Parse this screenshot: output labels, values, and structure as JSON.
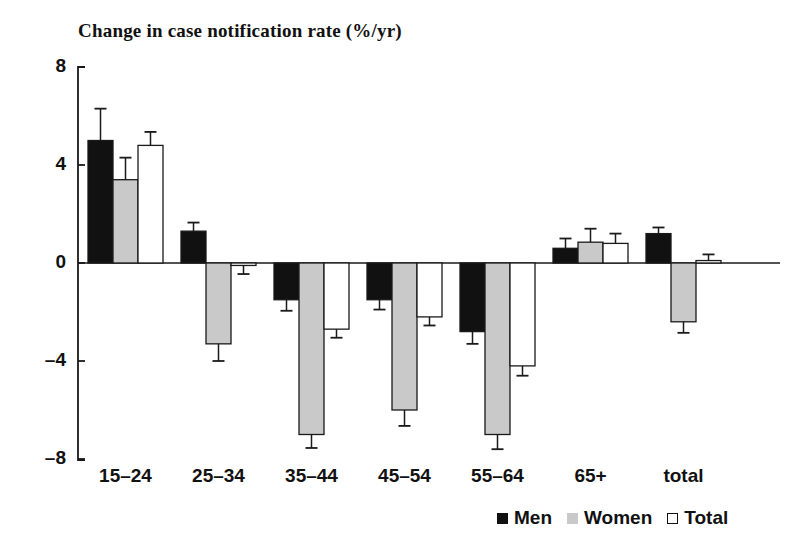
{
  "chart_data": {
    "type": "bar",
    "title": "Change in case notification rate (%/yr)",
    "xlabel": "",
    "ylabel": "",
    "ylim": [
      -8,
      8
    ],
    "yticks": [
      8,
      4,
      0,
      -4,
      -8
    ],
    "ytick_labels": [
      "8",
      "4",
      "0",
      "–4",
      "–8"
    ],
    "grid": false,
    "legend_position": "bottom-right",
    "error_bars": true,
    "categories": [
      "15–24",
      "25–34",
      "35–44",
      "45–54",
      "55–64",
      "65+",
      "total"
    ],
    "series": [
      {
        "name": "Men",
        "color": "#111111",
        "values": [
          5.0,
          1.3,
          -1.5,
          -1.5,
          -2.8,
          0.6,
          1.2
        ],
        "errors": [
          1.3,
          0.35,
          0.45,
          0.4,
          0.5,
          0.4,
          0.25
        ]
      },
      {
        "name": "Women",
        "color": "#c9c9c9",
        "values": [
          3.4,
          -3.3,
          -7.0,
          -6.0,
          -7.0,
          0.85,
          -2.4
        ],
        "errors": [
          0.9,
          0.7,
          0.55,
          0.65,
          0.6,
          0.55,
          0.45
        ]
      },
      {
        "name": "Total",
        "color": "#ffffff",
        "values": [
          4.8,
          -0.1,
          -2.7,
          -2.2,
          -4.2,
          0.8,
          0.1
        ],
        "errors": [
          0.55,
          0.35,
          0.35,
          0.35,
          0.4,
          0.4,
          0.25
        ]
      }
    ]
  },
  "legend": {
    "items": [
      {
        "label": "Men"
      },
      {
        "label": "Women"
      },
      {
        "label": "Total"
      }
    ]
  },
  "axis": {
    "y_tick_labels": [
      "8",
      "4",
      "0",
      "–4",
      "–8"
    ]
  }
}
